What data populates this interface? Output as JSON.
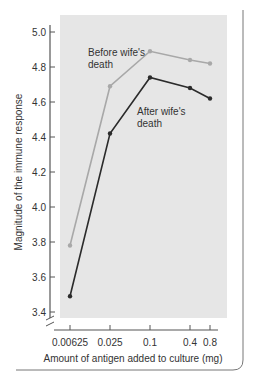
{
  "chart_data": {
    "type": "line",
    "title": "",
    "xlabel": "Amount of antigen added to culture (mg)",
    "ylabel": "Magnitude of the immune response",
    "x": [
      "0.00625",
      "0.025",
      "0.1",
      "0.4",
      "0.8"
    ],
    "ylim": [
      3.4,
      5.0
    ],
    "yticks": [
      "3.4",
      "3.6",
      "3.8",
      "4.0",
      "4.2",
      "4.4",
      "4.6",
      "4.8",
      "5.0"
    ],
    "grid": false,
    "series": [
      {
        "name": "Before wife's death",
        "color": "#a8a8a8",
        "values": [
          3.78,
          4.69,
          4.89,
          4.84,
          4.82
        ]
      },
      {
        "name": "After wife's death",
        "color": "#2b2b2b",
        "values": [
          3.49,
          4.42,
          4.74,
          4.68,
          4.62
        ]
      }
    ],
    "annotations": [
      {
        "text": [
          "Before wife's",
          "death"
        ],
        "series": "Before wife's death"
      },
      {
        "text": [
          "After wife's",
          "death"
        ],
        "series": "After wife's death"
      }
    ]
  },
  "colors": {
    "plot_bg": "#e6e6e6",
    "axis": "#555555",
    "frame": "#777777"
  }
}
